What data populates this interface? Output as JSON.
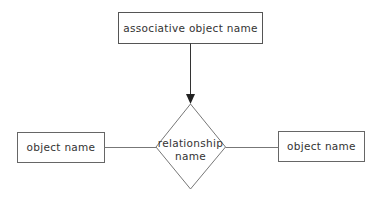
{
  "diagram": {
    "type": "entity-relationship",
    "nodes": [
      {
        "id": "assoc",
        "shape": "rectangle",
        "label": "associative object name"
      },
      {
        "id": "rel",
        "shape": "diamond",
        "label_line1": "relationship",
        "label_line2": "name"
      },
      {
        "id": "left_obj",
        "shape": "rectangle",
        "label": "object name"
      },
      {
        "id": "right_obj",
        "shape": "rectangle",
        "label": "object name"
      }
    ],
    "edges": [
      {
        "from": "assoc",
        "to": "rel",
        "arrow": true
      },
      {
        "from": "left_obj",
        "to": "rel",
        "arrow": false
      },
      {
        "from": "rel",
        "to": "right_obj",
        "arrow": false
      }
    ],
    "colors": {
      "stroke": "#555555",
      "text": "#333333",
      "background": "#ffffff"
    }
  }
}
